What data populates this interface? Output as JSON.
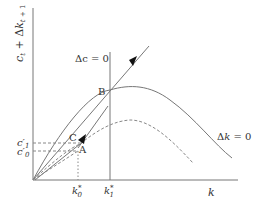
{
  "diagram": {
    "y_axis_label": "c_t + Δk_{t+1}",
    "x_axis_label": "k",
    "curves": {
      "delta_c_zero": "Δc = 0",
      "delta_k_zero": "Δk = 0"
    },
    "points": {
      "A": "A",
      "B": "B",
      "C": "C"
    },
    "y_ticks": {
      "c1": "c′",
      "c1_sub": "1",
      "c0": "c′",
      "c0_sub": "0"
    },
    "x_ticks": {
      "k0": "k",
      "k0_sub": "0",
      "k0_sup": "*",
      "k1": "k",
      "k1_sub": "1",
      "k1_sup": "*"
    },
    "colors": {
      "line": "#6f6f6f",
      "text": "#333333"
    }
  }
}
